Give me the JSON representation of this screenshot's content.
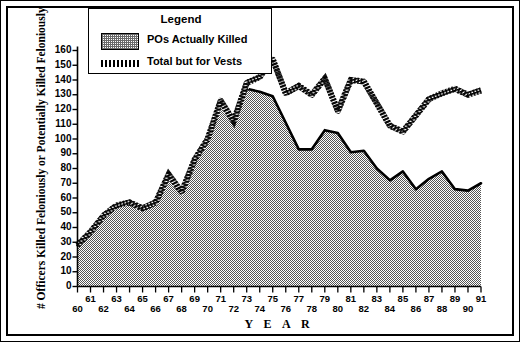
{
  "chart_data": {
    "type": "area",
    "title": "",
    "xlabel": "Y E A R",
    "ylabel": "# Officers Killed Feloniously or Potentially Killed Feloniously",
    "x": [
      60,
      61,
      62,
      63,
      64,
      65,
      66,
      67,
      68,
      69,
      70,
      71,
      72,
      73,
      74,
      75,
      76,
      77,
      78,
      79,
      80,
      81,
      82,
      83,
      84,
      85,
      86,
      87,
      88,
      89,
      90,
      91
    ],
    "xtick_labels_top": [
      "61",
      "63",
      "65",
      "67",
      "69",
      "71",
      "73",
      "75",
      "77",
      "79",
      "81",
      "83",
      "85",
      "87",
      "89",
      "91"
    ],
    "xtick_labels_bottom": [
      "60",
      "62",
      "64",
      "66",
      "68",
      "70",
      "72",
      "74",
      "76",
      "78",
      "80",
      "82",
      "84",
      "86",
      "88",
      "90"
    ],
    "ytick_labels": [
      "0",
      "10",
      "20",
      "30",
      "40",
      "50",
      "60",
      "70",
      "80",
      "90",
      "100",
      "110",
      "120",
      "130",
      "140",
      "150",
      "160"
    ],
    "ylim": [
      0,
      160
    ],
    "xlim": [
      60,
      91
    ],
    "grid": false,
    "legend_position": "top-center",
    "legend_title": "Legend",
    "series": [
      {
        "name": "POs Actually Killed",
        "style": "filled-area-stipple",
        "values": [
          28,
          37,
          48,
          55,
          57,
          53,
          57,
          76,
          64,
          86,
          100,
          126,
          112,
          134,
          132,
          129,
          111,
          93,
          93,
          106,
          104,
          91,
          92,
          80,
          72,
          78,
          66,
          73,
          78,
          66,
          65,
          70
        ]
      },
      {
        "name": "Total but for Vests",
        "style": "hatched-line",
        "values": [
          28,
          37,
          48,
          55,
          57,
          53,
          57,
          76,
          64,
          86,
          100,
          126,
          112,
          138,
          142,
          154,
          131,
          136,
          130,
          141,
          119,
          140,
          139,
          124,
          109,
          105,
          116,
          127,
          131,
          134,
          130,
          133
        ]
      }
    ]
  },
  "legend": {
    "title": "Legend",
    "items": [
      {
        "label": "POs Actually Killed",
        "swatch": "stipple-fill"
      },
      {
        "label": "Total but for Vests",
        "swatch": "hatched-line"
      }
    ]
  },
  "axes": {
    "y_title": "# Officers Killed Feloniously or Potentially Killed Feloniously",
    "x_title": "Y E A R"
  },
  "colors": {
    "ink": "#000000",
    "background": "#ffffff",
    "area_fill": "#c9c9c9"
  }
}
